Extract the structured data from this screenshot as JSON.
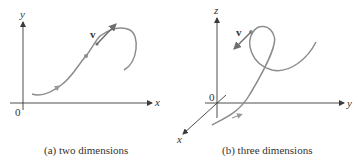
{
  "panels": [
    {
      "id": "a",
      "caption": "(a)  two dimensions",
      "axes": {
        "x_label": "x",
        "y_label": "y",
        "origin_label": "0"
      },
      "vector_label": "v"
    },
    {
      "id": "b",
      "caption": "(b)  three dimensions",
      "axes": {
        "x_label": "x",
        "y_label": "y",
        "z_label": "z",
        "origin_label": "0"
      },
      "vector_label": "v"
    }
  ],
  "colors": {
    "axis": "#3a3a3a",
    "curve": "#8c8c8c",
    "vector": "#6e6e6e",
    "text": "#333333"
  }
}
